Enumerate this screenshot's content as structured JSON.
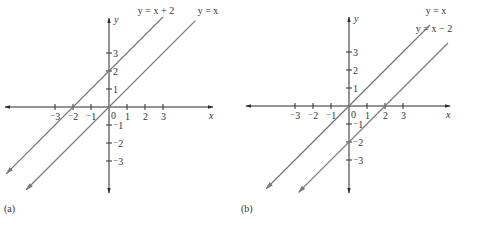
{
  "chart_data": [
    {
      "type": "line",
      "panel_label": "(a)",
      "title": "",
      "xlabel": "x",
      "ylabel": "y",
      "xlim": [
        -5.8,
        6.2
      ],
      "ylim": [
        -4.8,
        5.0
      ],
      "grid": false,
      "x_ticks": [
        -3,
        -2,
        -1,
        1,
        2,
        3
      ],
      "y_ticks": [
        -3,
        -2,
        -1,
        1,
        2,
        3
      ],
      "x_tick_labels": [
        "⁻3",
        "⁻2",
        "⁻1",
        "1",
        "2",
        "3"
      ],
      "y_tick_labels": [
        "⁻3",
        "⁻2",
        "⁻1",
        "1",
        "2",
        "3"
      ],
      "origin_label": "0",
      "series": [
        {
          "name": "y = x + 2",
          "slope": 1,
          "intercept": 2,
          "x_range": [
            -5.7,
            3.0
          ]
        },
        {
          "name": "y = x",
          "slope": 1,
          "intercept": 0,
          "x_range": [
            -4.6,
            4.8
          ]
        }
      ]
    },
    {
      "type": "line",
      "panel_label": "(b)",
      "title": "",
      "xlabel": "x",
      "ylabel": "y",
      "xlim": [
        -5.8,
        6.2
      ],
      "ylim": [
        -4.8,
        5.0
      ],
      "grid": false,
      "x_ticks": [
        -3,
        -2,
        -1,
        1,
        2,
        3
      ],
      "y_ticks": [
        -3,
        -2,
        -1,
        1,
        2,
        3
      ],
      "x_tick_labels": [
        "⁻3",
        "⁻2",
        "⁻1",
        "1",
        "2",
        "3"
      ],
      "y_tick_labels": [
        "⁻3",
        "⁻2",
        "⁻1",
        "1",
        "2",
        "3"
      ],
      "origin_label": "0",
      "series": [
        {
          "name": "y = x",
          "slope": 1,
          "intercept": 0,
          "x_range": [
            -4.6,
            4.5
          ]
        },
        {
          "name": "y = x − 2",
          "slope": 1,
          "intercept": -2,
          "x_range": [
            -2.8,
            5.5
          ]
        }
      ]
    }
  ],
  "layout": {
    "panels": [
      {
        "origin": [
          109,
          107
        ],
        "unit": 18,
        "x_axis": [
          5,
          213
        ],
        "y_axis": [
          18,
          193
        ],
        "label_pos": [
          4,
          208
        ]
      },
      {
        "origin": [
          349,
          106
        ],
        "unit": 18,
        "x_axis": [
          246,
          450
        ],
        "y_axis": [
          17,
          193
        ],
        "label_pos": [
          240,
          208
        ]
      }
    ],
    "series_label_pos": [
      [
        [
          156,
          14
        ],
        [
          208,
          14
        ]
      ],
      [
        [
          436,
          14
        ],
        [
          434,
          32
        ]
      ]
    ]
  }
}
